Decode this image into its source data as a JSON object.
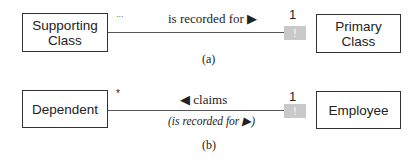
{
  "diagram_a": {
    "left_class": {
      "line1": "Supporting",
      "line2": "Class"
    },
    "right_class": {
      "line1": "Primary",
      "line2": "Class"
    },
    "left_multiplicity": "...",
    "right_multiplicity": "1",
    "association_label": "is recorded for ▶",
    "identifier_marker": "!",
    "caption": "(a)"
  },
  "diagram_b": {
    "left_class": "Dependent",
    "right_class": "Employee",
    "left_multiplicity": "*",
    "right_multiplicity": "1",
    "association_label": "◀ claims",
    "association_sublabel": "(is recorded for ▶)",
    "identifier_marker": "!",
    "caption": "(b)"
  },
  "colors": {
    "marker_fill": "#c9c9c9",
    "line": "#555555",
    "border": "#333333"
  }
}
